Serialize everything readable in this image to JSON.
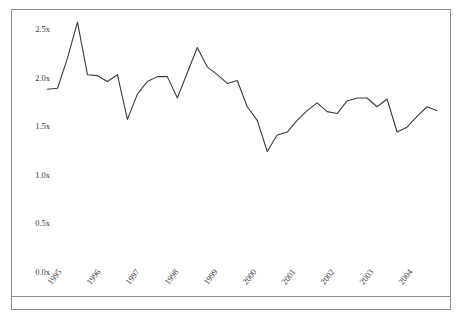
{
  "figure": {
    "top_caption": "",
    "frame_color": "#8d8d8d",
    "line_color": "#3a3a3a",
    "background": "#ffffff"
  },
  "chart_data": {
    "type": "line",
    "title": "",
    "subtitle": "",
    "xlabel": "",
    "ylabel": "",
    "grid": false,
    "legend": "none",
    "xlim": [
      1995.0,
      2004.9
    ],
    "ylim": [
      0.0,
      2.62
    ],
    "ytick_labels": [
      "0.0x",
      "0.5x",
      "1.0x",
      "1.5x",
      "2.0x",
      "2.5x"
    ],
    "ytick_values": [
      0.0,
      0.5,
      1.0,
      1.5,
      2.0,
      2.5
    ],
    "xtick_labels": [
      "1995",
      "1996",
      "1997",
      "1998",
      "1999",
      "2000",
      "2001",
      "2002",
      "2003",
      "2004"
    ],
    "xtick_values": [
      1995,
      1996,
      1997,
      1998,
      1999,
      2000,
      2001,
      2002,
      2003,
      2004
    ],
    "value_suffix": "x",
    "series": [
      {
        "name": "ratio",
        "color": "#3a3a3a",
        "x": [
          1995.0,
          1995.25,
          1995.5,
          1995.75,
          1996.0,
          1996.25,
          1996.5,
          1996.75,
          1997.0,
          1997.25,
          1997.5,
          1997.75,
          1998.0,
          1998.25,
          1998.5,
          1998.75,
          1999.0,
          1999.25,
          1999.5,
          1999.75,
          2000.0,
          2000.25,
          2000.5,
          2000.75,
          2001.0,
          2001.25,
          2001.5,
          2001.75,
          2002.0,
          2002.25,
          2002.5,
          2002.75,
          2003.0,
          2003.25,
          2003.5,
          2003.75,
          2004.0,
          2004.25,
          2004.5,
          2004.75
        ],
        "values": [
          1.88,
          1.89,
          2.2,
          2.57,
          2.03,
          2.02,
          1.96,
          2.03,
          1.57,
          1.83,
          1.96,
          2.01,
          2.01,
          1.79,
          2.05,
          2.31,
          2.11,
          2.03,
          1.94,
          1.97,
          1.7,
          1.56,
          1.24,
          1.41,
          1.44,
          1.56,
          1.66,
          1.74,
          1.65,
          1.63,
          1.76,
          1.79,
          1.79,
          1.7,
          1.78,
          1.44,
          1.49,
          1.6,
          1.7,
          1.66
        ]
      }
    ]
  }
}
